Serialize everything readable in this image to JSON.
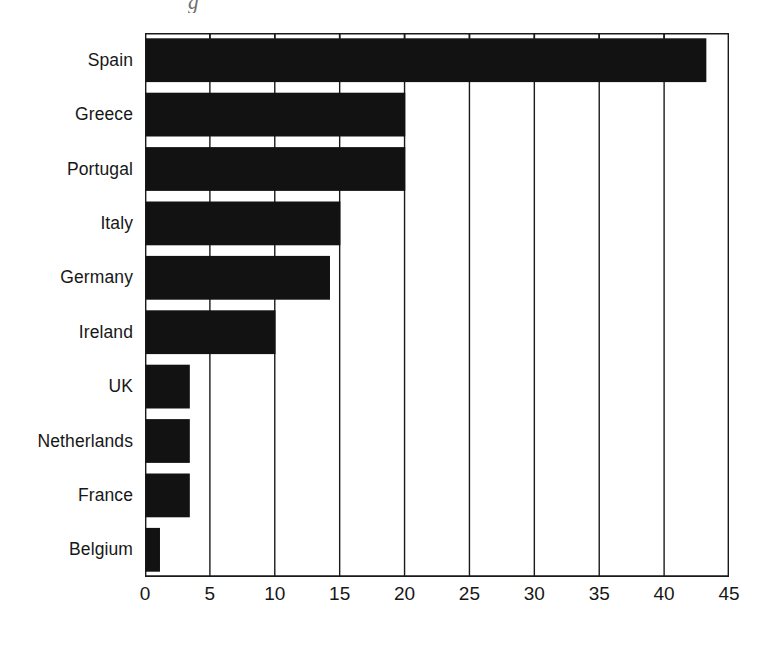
{
  "chart_data": {
    "type": "bar",
    "orientation": "horizontal",
    "title": "",
    "subtitle": "",
    "xlabel": "",
    "ylabel": "",
    "categories": [
      "Spain",
      "Greece",
      "Portugal",
      "Italy",
      "Germany",
      "Ireland",
      "UK",
      "Netherlands",
      "France",
      "Belgium"
    ],
    "values": [
      43.2,
      20,
      20,
      15,
      14.2,
      10,
      3.4,
      3.4,
      3.4,
      1.1
    ],
    "series": [
      {
        "name": "",
        "values": [
          43.2,
          20,
          20,
          15,
          14.2,
          10,
          3.4,
          3.4,
          3.4,
          1.1
        ]
      }
    ],
    "xlim": [
      0,
      45
    ],
    "xticks": [
      0,
      5,
      10,
      15,
      20,
      25,
      30,
      35,
      40,
      45
    ],
    "xtick_labels": [
      "0",
      "5",
      "10",
      "15",
      "20",
      "25",
      "30",
      "35",
      "40",
      "45"
    ],
    "grid": "vertical-only",
    "legend": "none",
    "bar_color": "#121212",
    "axis_color": "#1a1a1a",
    "background_color": "#ffffff",
    "annotations": []
  },
  "artifact": {
    "text": "g"
  }
}
